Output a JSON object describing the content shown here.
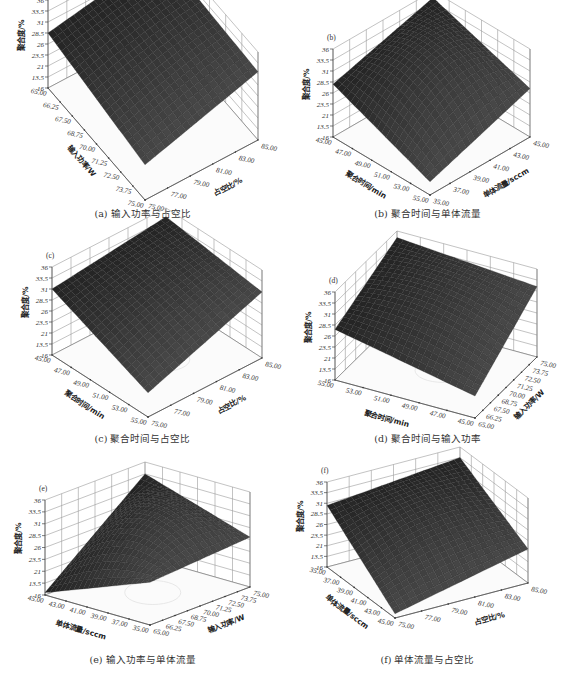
{
  "figure": {
    "panels": [
      {
        "id": "a",
        "letter": "(a)",
        "caption": "(a) 输入功率与占空比",
        "caption_y": 206
      },
      {
        "id": "b",
        "letter": "(b)",
        "caption": "(b) 聚合时间与单体流量",
        "caption_y": 206
      },
      {
        "id": "c",
        "letter": "(c)",
        "caption": "(c) 聚合时间与占空比",
        "caption_y": 206
      },
      {
        "id": "d",
        "letter": "(d)",
        "caption": "(d) 聚合时间与输入功率",
        "caption_y": 206
      },
      {
        "id": "e",
        "letter": "(e)",
        "caption": "(e) 输入功率与单体流量",
        "caption_y": 206
      },
      {
        "id": "f",
        "letter": "(f)",
        "caption": "(f) 单体流量与占空比",
        "caption_y": 206
      }
    ]
  },
  "chart_data": [
    {
      "type": "surface3d",
      "panel": "a",
      "title": "(a) 输入功率与占空比",
      "zlabel": "聚合度/%",
      "zticks": [
        "36",
        "33.5",
        "31",
        "28.5",
        "26",
        "23.5",
        "21",
        "13.5",
        "16"
      ],
      "xlabel": "输入功率/W",
      "xticks": [
        "65.00",
        "66.25",
        "67.50",
        "68.75",
        "70.00",
        "71.25",
        "72.50",
        "73.75",
        "75.00"
      ],
      "ylabel": "占空比/%",
      "yticks": [
        "75.00",
        "77.00",
        "79.00",
        "81.00",
        "83.00",
        "85.00"
      ],
      "surface": {
        "shape": "saddle-ridge",
        "z_left": 28.5,
        "z_back": 33.0,
        "z_right": 31.5,
        "z_front": 24.0,
        "z_center": 30.0
      },
      "grid": true
    },
    {
      "type": "surface3d",
      "panel": "b",
      "title": "(b) 聚合时间与单体流量",
      "zlabel": "聚合度/%",
      "zticks": [
        "36",
        "33.5",
        "31",
        "28.5",
        "26",
        "23.5",
        "21",
        "13.5",
        "16"
      ],
      "xlabel": "聚合时间/min",
      "xticks": [
        "45.00",
        "47.00",
        "49.00",
        "51.00",
        "53.00",
        "55.00"
      ],
      "ylabel": "单体流量/sccm",
      "yticks": [
        "35.00",
        "37.00",
        "39.00",
        "41.00",
        "43.00",
        "45.00"
      ],
      "surface": {
        "shape": "dome",
        "z_left": 28.0,
        "z_back": 34.5,
        "z_right": 27.0,
        "z_front": 19.0,
        "z_center": 33.0
      },
      "grid": true
    },
    {
      "type": "surface3d",
      "panel": "c",
      "title": "(c) 聚合时间与占空比",
      "zlabel": "聚合度/%",
      "zticks": [
        "36",
        "33.5",
        "31",
        "28.5",
        "26",
        "23.5",
        "21",
        "13.5",
        "16"
      ],
      "xlabel": "聚合时间/min",
      "xticks": [
        "45.00",
        "47.00",
        "49.00",
        "51.00",
        "53.00",
        "55.00"
      ],
      "ylabel": "占空比/%",
      "yticks": [
        "75.00",
        "77.00",
        "79.00",
        "81.00",
        "83.00",
        "85.00"
      ],
      "surface": {
        "shape": "plane",
        "z_left": 31.0,
        "z_back": 34.0,
        "z_right": 31.0,
        "z_front": 21.5,
        "z_center": 30.5
      },
      "grid": true
    },
    {
      "type": "surface3d",
      "panel": "d",
      "title": "(d) 聚合时间与输入功率",
      "zlabel": "聚合度/%",
      "zticks": [
        "36",
        "33.5",
        "31",
        "28.5",
        "26",
        "23.5",
        "21",
        "13.5",
        "16"
      ],
      "xlabel": "聚合时间/min",
      "xticks": [
        "55.00",
        "53.00",
        "51.00",
        "49.00",
        "47.00",
        "45.00"
      ],
      "ylabel": "输入功率/W",
      "yticks": [
        "65.00",
        "66.25",
        "67.50",
        "68.75",
        "70.00",
        "71.25",
        "72.50",
        "73.75",
        "75.00"
      ],
      "surface": {
        "shape": "gentle-dome",
        "z_left": 27.5,
        "z_back": 34.5,
        "z_right": 32.0,
        "z_front": 21.0,
        "z_center": 31.5
      },
      "grid": true
    },
    {
      "type": "surface3d",
      "panel": "e",
      "title": "(e) 输入功率与单体流量",
      "zlabel": "聚合度/%",
      "zticks": [
        "36",
        "33.5",
        "31",
        "28.5",
        "26",
        "23.5",
        "21",
        "13.5",
        "16"
      ],
      "xlabel": "单体流量/sccm",
      "xticks": [
        "45.00",
        "43.00",
        "41.00",
        "39.00",
        "37.00",
        "35.00"
      ],
      "ylabel": "输入功率/W",
      "yticks": [
        "65.00",
        "66.25",
        "67.50",
        "68.75",
        "70.00",
        "71.25",
        "72.50",
        "73.75",
        "75.00"
      ],
      "surface": {
        "shape": "arch",
        "z_left": 16.5,
        "z_back": 33.5,
        "z_right": 26.5,
        "z_front": 25.0,
        "z_center": 32.0
      },
      "grid": true
    },
    {
      "type": "surface3d",
      "panel": "f",
      "title": "(f) 单体流量与占空比",
      "zlabel": "聚合度/%",
      "zticks": [
        "36",
        "33.5",
        "31",
        "28.5",
        "26",
        "23.5",
        "21",
        "13.5",
        "16"
      ],
      "xlabel": "单体流量/sccm",
      "xticks": [
        "35.00",
        "37.00",
        "39.00",
        "41.00",
        "43.00",
        "45.00"
      ],
      "ylabel": "占空比/%",
      "yticks": [
        "75.00",
        "77.00",
        "79.00",
        "81.00",
        "83.00",
        "85.00"
      ],
      "surface": {
        "shape": "ridge",
        "z_left": 30.5,
        "z_back": 33.5,
        "z_right": 24.0,
        "z_front": 17.0,
        "z_center": 29.0
      },
      "grid": true
    }
  ]
}
